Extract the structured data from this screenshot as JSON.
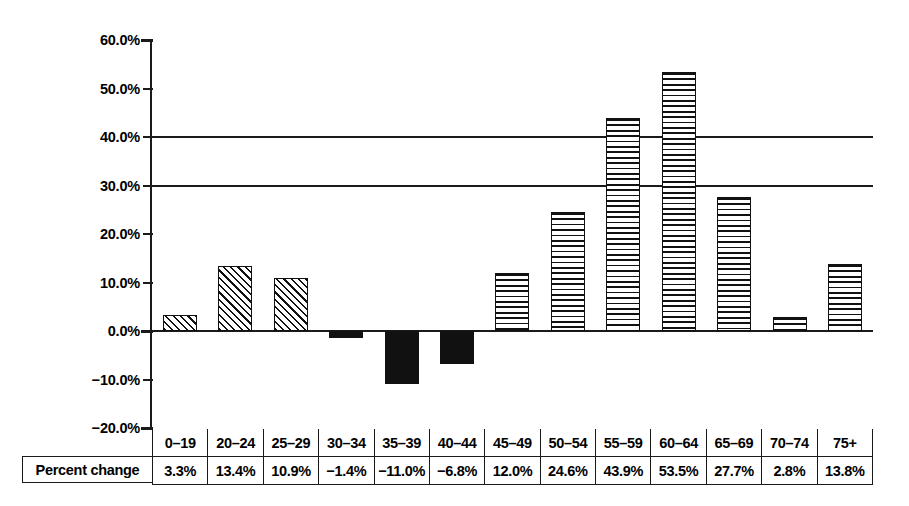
{
  "chart_data": {
    "type": "bar",
    "title": "",
    "subtitle": "",
    "xlabel": "",
    "ylabel": "",
    "ylim": [
      -20.0,
      60.0
    ],
    "ytick_step": 10.0,
    "grid": "horizontal gridlines at 30.0% and 40.0% only",
    "legend": "none",
    "categories": [
      "0–19",
      "20–24",
      "25–29",
      "30–34",
      "35–39",
      "40–44",
      "45–49",
      "50–54",
      "55–59",
      "60–64",
      "65–69",
      "70–74",
      "75+"
    ],
    "values": [
      3.3,
      13.4,
      10.9,
      -1.4,
      -11.0,
      -6.8,
      12.0,
      24.6,
      43.9,
      53.5,
      27.7,
      2.8,
      13.8
    ],
    "value_labels": [
      "3.3%",
      "13.4%",
      "10.9%",
      "−1.4%",
      "−11.0%",
      "−6.8%",
      "12.0%",
      "24.6%",
      "43.9%",
      "53.5%",
      "27.7%",
      "2.8%",
      "13.8%"
    ],
    "bar_fills": [
      "hatch-diagonal",
      "hatch-diagonal",
      "hatch-diagonal",
      "solid",
      "solid",
      "solid",
      "hatch-horizontal",
      "hatch-horizontal",
      "hatch-horizontal",
      "hatch-horizontal",
      "hatch-horizontal",
      "hatch-horizontal",
      "hatch-horizontal"
    ],
    "ytick_labels": [
      "60.0%",
      "50.0%",
      "40.0%",
      "30.0%",
      "20.0%",
      "10.0%",
      "0.0%",
      "−10.0%",
      "−20.0%"
    ],
    "ytick_values": [
      60.0,
      50.0,
      40.0,
      30.0,
      20.0,
      10.0,
      0.0,
      -10.0,
      -20.0
    ],
    "gridline_values": [
      40.0,
      30.0
    ],
    "colors": {
      "ink": "#111111",
      "background": "#ffffff"
    }
  },
  "table": {
    "row_label": "Percent change",
    "header": [
      "0–19",
      "20–24",
      "25–29",
      "30–34",
      "35–39",
      "40–44",
      "45–49",
      "50–54",
      "55–59",
      "60–64",
      "65–69",
      "70–74",
      "75+"
    ],
    "values": [
      "3.3%",
      "13.4%",
      "10.9%",
      "−1.4%",
      "−11.0%",
      "−6.8%",
      "12.0%",
      "24.6%",
      "43.9%",
      "53.5%",
      "27.7%",
      "2.8%",
      "13.8%"
    ]
  }
}
